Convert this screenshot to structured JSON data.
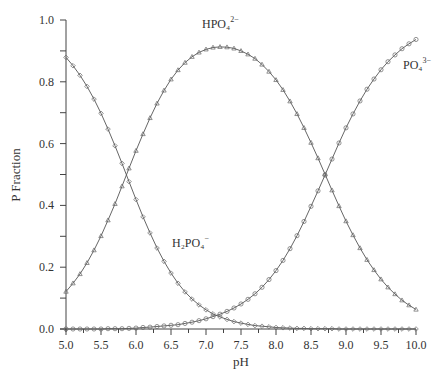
{
  "chart_data": {
    "type": "line",
    "title": "",
    "xlabel": "pH",
    "ylabel": "P Fraction",
    "xlim": [
      5.0,
      10.0
    ],
    "ylim": [
      0.0,
      1.0
    ],
    "grid": false,
    "legend": "inline labels",
    "x_ticks": [
      "5.0",
      "5.5",
      "6.0",
      "6.5",
      "7.0",
      "7.5",
      "8.0",
      "8.5",
      "9.0",
      "9.5",
      "10.0"
    ],
    "y_ticks": [
      "0.0",
      "0.2",
      "0.4",
      "0.6",
      "0.8",
      "1.0"
    ],
    "x": [
      5.0,
      5.1,
      5.2,
      5.3,
      5.4,
      5.5,
      5.6,
      5.7,
      5.8,
      5.9,
      6.0,
      6.1,
      6.2,
      6.3,
      6.4,
      6.5,
      6.6,
      6.7,
      6.8,
      6.9,
      7.0,
      7.1,
      7.2,
      7.3,
      7.4,
      7.5,
      7.6,
      7.7,
      7.8,
      7.9,
      8.0,
      8.1,
      8.2,
      8.3,
      8.4,
      8.5,
      8.6,
      8.7,
      8.8,
      8.9,
      9.0,
      9.1,
      9.2,
      9.3,
      9.4,
      9.5,
      9.6,
      9.7,
      9.8,
      9.9,
      10.0
    ],
    "series": [
      {
        "name": "H2PO4-",
        "label_html": "H₂PO₄⁻",
        "marker": "diamond",
        "values": [
          0.879,
          0.852,
          0.821,
          0.785,
          0.744,
          0.698,
          0.647,
          0.593,
          0.536,
          0.477,
          0.419,
          0.363,
          0.311,
          0.262,
          0.219,
          0.181,
          0.148,
          0.12,
          0.097,
          0.078,
          0.062,
          0.049,
          0.039,
          0.031,
          0.024,
          0.019,
          0.015,
          0.011,
          0.009,
          0.007,
          0.005,
          0.004,
          0.003,
          0.002,
          0.002,
          0.001,
          0.001,
          0.001,
          0.001,
          0.0,
          0.0,
          0.0,
          0.0,
          0.0,
          0.0,
          0.0,
          0.0,
          0.0,
          0.0,
          0.0,
          0.0
        ]
      },
      {
        "name": "HPO42-",
        "label_html": "HPO₄²⁻",
        "marker": "triangle",
        "values": [
          0.121,
          0.148,
          0.178,
          0.214,
          0.255,
          0.301,
          0.352,
          0.405,
          0.462,
          0.52,
          0.577,
          0.631,
          0.683,
          0.73,
          0.772,
          0.808,
          0.838,
          0.862,
          0.881,
          0.895,
          0.905,
          0.911,
          0.913,
          0.912,
          0.908,
          0.9,
          0.889,
          0.875,
          0.856,
          0.833,
          0.806,
          0.774,
          0.737,
          0.696,
          0.651,
          0.603,
          0.553,
          0.501,
          0.449,
          0.398,
          0.349,
          0.304,
          0.262,
          0.224,
          0.191,
          0.161,
          0.135,
          0.113,
          0.093,
          0.077,
          0.063
        ]
      },
      {
        "name": "PO43-",
        "label_html": "PO₄³⁻",
        "marker": "circle",
        "values": [
          0.0,
          0.0,
          0.0,
          0.0,
          0.0,
          0.0,
          0.001,
          0.001,
          0.001,
          0.002,
          0.003,
          0.005,
          0.006,
          0.008,
          0.01,
          0.012,
          0.014,
          0.018,
          0.022,
          0.027,
          0.033,
          0.04,
          0.048,
          0.057,
          0.068,
          0.081,
          0.096,
          0.114,
          0.135,
          0.16,
          0.189,
          0.222,
          0.26,
          0.302,
          0.348,
          0.397,
          0.447,
          0.498,
          0.55,
          0.602,
          0.651,
          0.696,
          0.738,
          0.776,
          0.809,
          0.839,
          0.865,
          0.887,
          0.907,
          0.923,
          0.937
        ]
      }
    ],
    "annotations": [
      {
        "text": "HPO4 2-",
        "x": 7.2,
        "y": 0.98
      },
      {
        "text": "PO4 3-",
        "x": 9.85,
        "y": 0.87
      },
      {
        "text": "H2PO4 -",
        "x": 6.3,
        "y": 0.37
      }
    ]
  },
  "labels": {
    "xlabel": "pH",
    "ylabel": "P Fraction",
    "h2po4_base": "H₂PO₄",
    "h2po4_sup": "−",
    "hpo4_base": "HPO₄",
    "hpo4_sup": "2−",
    "po4_base": "PO₄",
    "po4_sup": "3−"
  }
}
